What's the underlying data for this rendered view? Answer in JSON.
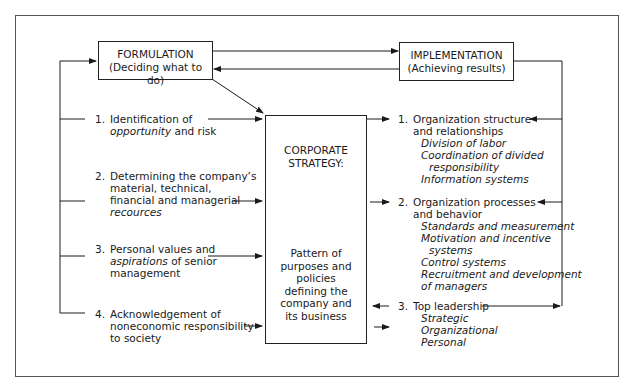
{
  "diagram": {
    "formulation": {
      "title": "FORMULATION",
      "subtitle": "(Deciding what to do)"
    },
    "implementation": {
      "title": "IMPLEMENTATION",
      "subtitle": "(Achieving results)"
    },
    "corporate_strategy": {
      "title_line1": "CORPORATE",
      "title_line2": "STRATEGY:",
      "description_lines": [
        "Pattern of",
        "purposes and",
        "policies",
        "defining the",
        "company and",
        "its business"
      ]
    },
    "formulation_inputs": [
      {
        "num": "1.",
        "lines": [
          [
            {
              "t": "Identification of",
              "i": false
            }
          ],
          [
            {
              "t": "opportunity",
              "i": true
            },
            {
              "t": " and risk",
              "i": false
            }
          ]
        ]
      },
      {
        "num": "2.",
        "lines": [
          [
            {
              "t": "Determining the company’s",
              "i": false
            }
          ],
          [
            {
              "t": "material, technical,",
              "i": false
            }
          ],
          [
            {
              "t": "financial and managerial",
              "i": false
            }
          ],
          [
            {
              "t": "recources",
              "i": true
            }
          ]
        ]
      },
      {
        "num": "3.",
        "lines": [
          [
            {
              "t": "Personal values and",
              "i": false
            }
          ],
          [
            {
              "t": "aspirations",
              "i": true
            },
            {
              "t": " of senior",
              "i": false
            }
          ],
          [
            {
              "t": "management",
              "i": false
            }
          ]
        ]
      },
      {
        "num": "4.",
        "lines": [
          [
            {
              "t": "Acknowledgement of",
              "i": false
            }
          ],
          [
            {
              "t": "noneconomic responsibility",
              "i": false
            }
          ],
          [
            {
              "t": "to society",
              "i": false
            }
          ]
        ]
      }
    ],
    "implementation_outputs": [
      {
        "num": "1.",
        "heading": [
          "Organization structure",
          "and relationships"
        ],
        "subitems": [
          "Division of labor",
          "Coordination of divided",
          "responsibility",
          "Information systems"
        ]
      },
      {
        "num": "2.",
        "heading": [
          "Organization processes",
          "and behavior"
        ],
        "subitems": [
          "Standards and measurement",
          "Motivation and incentive",
          "systems",
          "Control systems",
          "Recruitment and development",
          "of managers"
        ]
      },
      {
        "num": "3.",
        "heading": [
          "Top leadership"
        ],
        "subitems": [
          "Strategic",
          "Organizational",
          "Personal"
        ]
      }
    ]
  }
}
